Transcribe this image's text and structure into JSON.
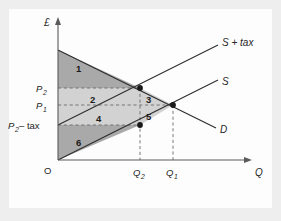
{
  "figure": {
    "type": "economics-supply-demand-tax-diagram",
    "axes": {
      "y_label": "£",
      "x_label": "Q",
      "origin_label": "O"
    },
    "curves": [
      {
        "id": "supply-plus-tax",
        "label": "S + tax"
      },
      {
        "id": "supply",
        "label": "S"
      },
      {
        "id": "demand",
        "label": "D"
      }
    ],
    "price_ticks": [
      {
        "id": "p2",
        "label": "P",
        "subscript": "2",
        "suffix": ""
      },
      {
        "id": "p1",
        "label": "P",
        "subscript": "1",
        "suffix": ""
      },
      {
        "id": "p2-minus-tax",
        "label": "P",
        "subscript": "2",
        "suffix": " – tax"
      }
    ],
    "quantity_ticks": [
      {
        "id": "q2",
        "label": "Q",
        "subscript": "2"
      },
      {
        "id": "q1",
        "label": "Q",
        "subscript": "1"
      }
    ],
    "regions": [
      {
        "id": "region-1",
        "label": "1",
        "shade": "dark"
      },
      {
        "id": "region-2",
        "label": "2",
        "shade": "light"
      },
      {
        "id": "region-3",
        "label": "3",
        "shade": "light"
      },
      {
        "id": "region-4",
        "label": "4",
        "shade": "light"
      },
      {
        "id": "region-5",
        "label": "5",
        "shade": "light"
      },
      {
        "id": "region-6",
        "label": "6",
        "shade": "dark"
      }
    ],
    "colors": {
      "panel_background": "#fdfdfd",
      "outer_background": "#eeeeee",
      "region_dark": "#a9a9a9",
      "region_light": "#d2d2d2",
      "axis": "#5a5a5a",
      "curve": "#2e2e2e",
      "dashed": "#6b6b6b",
      "marker": "#1a1a1a"
    }
  }
}
